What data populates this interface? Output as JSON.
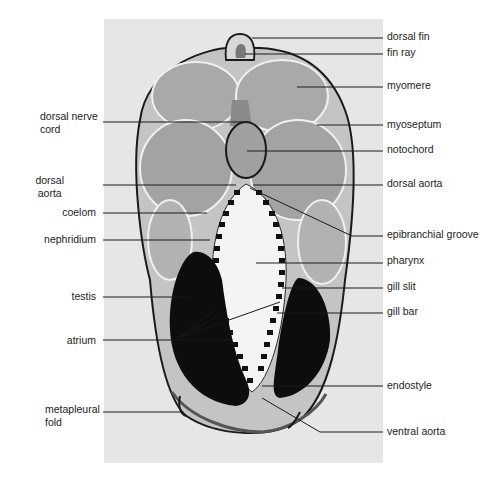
{
  "figure": {
    "panel": {
      "x": 104,
      "y": 19,
      "w": 279,
      "h": 444,
      "color": "#e6e6e6"
    },
    "colors": {
      "line": "#1a1a1a",
      "text": "#222222",
      "muscle": "#b9b9b9",
      "muscle_dark": "#8e8e8e",
      "gonad": "#0d0d0d",
      "pharynx": "#f4f4f4",
      "notochord": "#a4a4a4"
    }
  },
  "labels_left": [
    {
      "id": "dorsal-nerve-cord",
      "text": "dorsal nerve\ncord",
      "x": 40,
      "y": 110,
      "line": [
        [
          103,
          122
        ],
        [
          245,
          122
        ]
      ]
    },
    {
      "id": "dorsal-aorta-left",
      "text": "dorsal\naorta",
      "x": 40,
      "y": 176,
      "line": [
        [
          103,
          185
        ],
        [
          236,
          185
        ]
      ]
    },
    {
      "id": "coelom",
      "text": "coelom",
      "x": 40,
      "y": 206,
      "line": [
        [
          103,
          213
        ],
        [
          207,
          213
        ]
      ]
    },
    {
      "id": "nephridium",
      "text": "nephridium",
      "x": 40,
      "y": 233,
      "line": [
        [
          103,
          240
        ],
        [
          210,
          240
        ]
      ]
    },
    {
      "id": "testis",
      "text": "testis",
      "x": 40,
      "y": 290,
      "line": [
        [
          103,
          297
        ],
        [
          190,
          297
        ]
      ]
    },
    {
      "id": "atrium",
      "text": "atrium",
      "x": 40,
      "y": 334,
      "line": [
        [
          103,
          340
        ],
        [
          230,
          340
        ]
      ]
    },
    {
      "id": "metapleural-fold",
      "text": "metapleural\nfold",
      "x": 40,
      "y": 403,
      "line": [
        [
          103,
          412
        ],
        [
          183,
          412
        ]
      ]
    }
  ],
  "labels_right": [
    {
      "id": "dorsal-fin",
      "text": "dorsal fin",
      "x": 387,
      "y": 30,
      "line": [
        [
          252,
          38
        ],
        [
          383,
          38
        ]
      ]
    },
    {
      "id": "fin-ray",
      "text": "fin ray",
      "x": 387,
      "y": 46,
      "line": [
        [
          245,
          54
        ],
        [
          383,
          54
        ]
      ]
    },
    {
      "id": "myomere",
      "text": "myomere",
      "x": 387,
      "y": 79,
      "line": [
        [
          297,
          87
        ],
        [
          383,
          87
        ]
      ]
    },
    {
      "id": "myoseptum",
      "text": "myoseptum",
      "x": 387,
      "y": 118,
      "line": [
        [
          317,
          125
        ],
        [
          383,
          125
        ]
      ]
    },
    {
      "id": "notochord",
      "text": "notochord",
      "x": 387,
      "y": 143,
      "line": [
        [
          247,
          151
        ],
        [
          383,
          151
        ]
      ]
    },
    {
      "id": "dorsal-aorta-right",
      "text": "dorsal aorta",
      "x": 387,
      "y": 177,
      "line": [
        [
          253,
          185
        ],
        [
          383,
          185
        ]
      ]
    },
    {
      "id": "epibranchial-groove",
      "text": "epibranchial groove",
      "x": 387,
      "y": 228,
      "line": [
        [
          250,
          188
        ],
        [
          352,
          236
        ],
        [
          383,
          236
        ]
      ]
    },
    {
      "id": "pharynx",
      "text": "pharynx",
      "x": 387,
      "y": 254,
      "line": [
        [
          256,
          263
        ],
        [
          383,
          263
        ]
      ]
    },
    {
      "id": "gill-slit",
      "text": "gill slit",
      "x": 387,
      "y": 280,
      "line": [
        [
          282,
          288
        ],
        [
          383,
          288
        ]
      ]
    },
    {
      "id": "gill-bar",
      "text": "gill bar",
      "x": 387,
      "y": 305,
      "line": [
        [
          277,
          313
        ],
        [
          383,
          313
        ]
      ]
    },
    {
      "id": "endostyle",
      "text": "endostyle",
      "x": 387,
      "y": 379,
      "line": [
        [
          262,
          386
        ],
        [
          383,
          386
        ]
      ]
    },
    {
      "id": "ventral-aorta",
      "text": "ventral aorta",
      "x": 387,
      "y": 425,
      "line": [
        [
          262,
          398
        ],
        [
          320,
          432
        ],
        [
          383,
          432
        ]
      ]
    }
  ],
  "extra_leaders": [
    {
      "id": "atrium-leader-a",
      "points": [
        [
          178,
          338
        ],
        [
          214,
          310
        ]
      ]
    },
    {
      "id": "atrium-leader-b",
      "points": [
        [
          178,
          338
        ],
        [
          218,
          316
        ]
      ]
    },
    {
      "id": "gill-bar-leader",
      "points": [
        [
          178,
          338
        ],
        [
          280,
          302
        ]
      ]
    }
  ]
}
